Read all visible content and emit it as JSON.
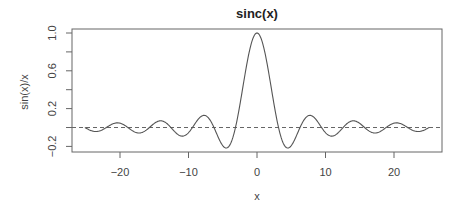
{
  "chart_data": {
    "type": "line",
    "title": "sinc(x)",
    "xlabel": "x",
    "ylabel": "sin(x)/x",
    "xlim": [
      -27,
      27
    ],
    "ylim": [
      -0.25,
      1.05
    ],
    "x_ticks": [
      -20,
      -10,
      0,
      10,
      20
    ],
    "x_tick_labels": [
      "−20",
      "−10",
      "0",
      "10",
      "20"
    ],
    "y_ticks": [
      -0.2,
      0.2,
      0.6,
      1.0
    ],
    "y_tick_labels": [
      "−0.2",
      "0.2",
      "0.6",
      "1.0"
    ],
    "y_minor_ticks": [
      0.0,
      0.4,
      0.8
    ],
    "grid": false,
    "reference_line": {
      "y": 0,
      "style": "dashed"
    },
    "series": [
      {
        "name": "sinc",
        "function": "sin(x)/x",
        "x_range": [
          -25.13,
          25.13
        ],
        "color": "#555555"
      }
    ],
    "key_points": [
      {
        "x": 0,
        "y": 1.0
      },
      {
        "x": -4.49,
        "y": -0.217
      },
      {
        "x": 4.49,
        "y": -0.217
      },
      {
        "x": -7.73,
        "y": 0.128
      },
      {
        "x": 7.73,
        "y": 0.128
      }
    ]
  }
}
